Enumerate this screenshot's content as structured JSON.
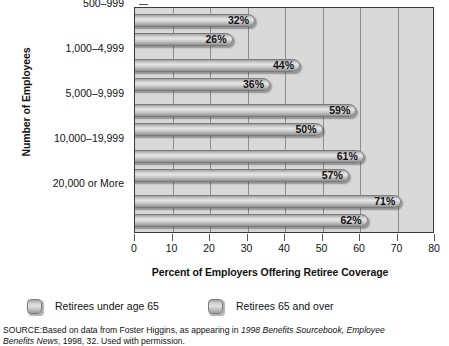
{
  "chart_data": {
    "type": "bar",
    "orientation": "horizontal",
    "title": "",
    "xlabel": "Percent of Employers Offering Retiree Coverage",
    "ylabel": "Number of Employees",
    "categories": [
      "500–999",
      "1,000–4,999",
      "5,000–9,999",
      "10,000–19,999",
      "20,000 or More"
    ],
    "series": [
      {
        "name": "Retirees under age 65",
        "values": [
          32,
          44,
          59,
          61,
          71
        ],
        "labels": [
          "32%",
          "44%",
          "59%",
          "61%",
          "71%"
        ]
      },
      {
        "name": "Retirees 65 and over",
        "values": [
          26,
          36,
          50,
          57,
          62
        ],
        "labels": [
          "26%",
          "36%",
          "50%",
          "57%",
          "62%"
        ]
      }
    ],
    "xlim": [
      0,
      80
    ],
    "xticks": [
      0,
      10,
      20,
      30,
      40,
      50,
      60,
      70,
      80
    ],
    "xtick_labels": [
      "0",
      "10",
      "20",
      "30",
      "40",
      "50",
      "60",
      "70",
      "80"
    ],
    "grid": "vertical",
    "legend_position": "below-axis",
    "colors": {
      "bar_fill_light": "#e6e6e6",
      "bar_fill_dark": "#8f8f8f",
      "bar_border": "#7b7b7b",
      "plot_background": "#d9d9d9",
      "axis": "#3a3a3a",
      "gridline": "#8d8d8d",
      "text": "#111111"
    }
  },
  "legend": {
    "items": [
      {
        "label": "Retirees under age 65"
      },
      {
        "label": "Retirees 65 and over"
      }
    ]
  },
  "source": {
    "line1_prefix": "SOURCE:Based on data from Foster Higgins, as appearing in ",
    "line1_italic": "1998 Benefits Sourcebook, Employee",
    "line2_italic": "Benefits News",
    "line2_suffix": ", 1998, 32. Used with permission."
  }
}
